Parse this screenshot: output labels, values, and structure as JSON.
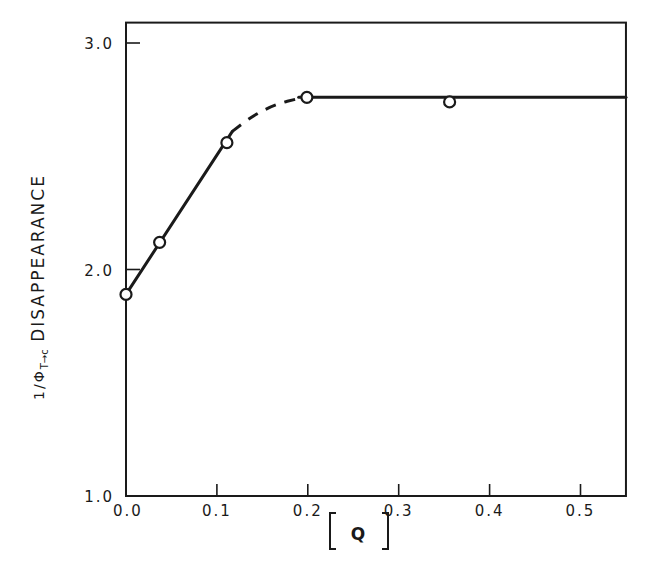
{
  "chart_data": {
    "type": "line",
    "title": "",
    "xlabel": "[ Q ]",
    "ylabel": "1/Φ T→c DISAPPEARANCE",
    "ylabel_parts": {
      "prefix": "1/Φ",
      "subscript": "T→c",
      "suffix": " DISAPPEARANCE"
    },
    "xlim": [
      0.0,
      0.55
    ],
    "ylim": [
      1.0,
      3.09
    ],
    "x_ticks": [
      0.0,
      0.1,
      0.2,
      0.3,
      0.4,
      0.5
    ],
    "x_tick_labels": [
      "0.0",
      "0.1",
      "0.2",
      "0.3",
      "0.4",
      "0.5"
    ],
    "y_ticks": [
      1.0,
      2.0,
      3.0
    ],
    "y_tick_labels": [
      "1.0",
      "2.0",
      "3.0"
    ],
    "grid": false,
    "legend": null,
    "series": [
      {
        "name": "measured",
        "marker": "open-circle",
        "x": [
          0.0,
          0.037,
          0.111,
          0.199,
          0.356
        ],
        "y": [
          1.89,
          2.12,
          2.56,
          2.76,
          2.74
        ]
      }
    ],
    "fit_lines": [
      {
        "style": "solid",
        "x": [
          0.0,
          0.117
        ],
        "y": [
          1.89,
          2.61
        ]
      },
      {
        "style": "dashed",
        "x": [
          0.117,
          0.14,
          0.165,
          0.19
        ],
        "y": [
          2.61,
          2.68,
          2.73,
          2.755
        ]
      },
      {
        "style": "solid",
        "x": [
          0.19,
          0.55
        ],
        "y": [
          2.76,
          2.76
        ]
      }
    ]
  }
}
